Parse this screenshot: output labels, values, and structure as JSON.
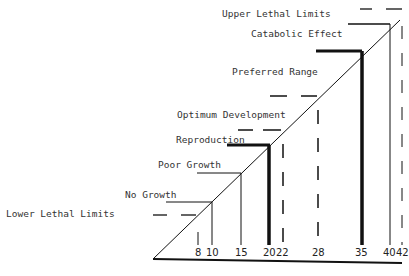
{
  "diagram": {
    "title": "",
    "axis": {
      "label": "",
      "ticks": [
        "8",
        "10",
        "15",
        "20",
        "22",
        "28",
        "35",
        "40",
        "42"
      ]
    },
    "zones": [
      {
        "label": "Lower Lethal Limits",
        "value": 8,
        "style": "dashed"
      },
      {
        "label": "No Growth",
        "value": 10,
        "style": "thin"
      },
      {
        "label": "Poor Growth",
        "value": 15,
        "style": "thin"
      },
      {
        "label": "Reproduction",
        "value": 20,
        "style": "thick"
      },
      {
        "label": "Optimum Development",
        "value": 22,
        "style": "dashed"
      },
      {
        "label": "Preferred Range",
        "value": 28,
        "style": "dashed"
      },
      {
        "label": "Catabolic Effect",
        "value": 35,
        "style": "thick"
      },
      {
        "label": "Upper Lethal Limits",
        "value": 40,
        "style": "thin"
      },
      {
        "label": "",
        "value": 42,
        "style": "dashed"
      }
    ],
    "colors": {
      "line": "#111111",
      "text": "#333333",
      "background": "#ffffff"
    }
  },
  "labels": {
    "lower_lethal": "Lower Lethal Limits",
    "no_growth": "No Growth",
    "poor_growth": "Poor Growth",
    "reproduction": "Reproduction",
    "optimum": "Optimum Development",
    "preferred": "Preferred Range",
    "catabolic": "Catabolic Effect",
    "upper_lethal": "Upper Lethal Limits"
  },
  "ticks": {
    "t8": "8",
    "t10": "10",
    "t15": "15",
    "t20": "20",
    "t22": "22",
    "t28": "28",
    "t35": "35",
    "t40": "40",
    "t42": "42"
  }
}
